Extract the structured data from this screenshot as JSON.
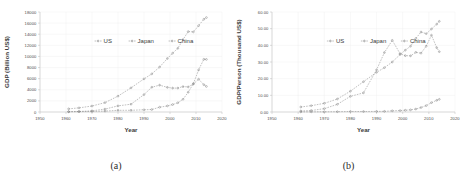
{
  "figure": {
    "panels": [
      {
        "caption": "(a)",
        "name": "gdp-total-chart",
        "chart_index": 0
      },
      {
        "caption": "(b)",
        "name": "gdp-per-person-chart",
        "chart_index": 1
      }
    ],
    "colors": {
      "line": "#8d8d8d",
      "grid": "#ededed",
      "axis": "#b9b9b9",
      "text": "#4a4a4a",
      "background": "#ffffff"
    }
  },
  "chart_data": [
    {
      "type": "line",
      "title": "",
      "xlabel": "Year",
      "ylabel": "GDP (Billion US$)",
      "xlim": [
        1950,
        2020
      ],
      "ylim": [
        0,
        18000
      ],
      "xticks": [
        1950,
        1960,
        1970,
        1980,
        1990,
        2000,
        2010,
        2020
      ],
      "yticks": [
        0,
        2000,
        4000,
        6000,
        8000,
        10000,
        12000,
        14000,
        16000,
        18000
      ],
      "ytick_labels": [
        "0",
        "2000",
        "4000",
        "6000",
        "8000",
        "10000",
        "12000",
        "14000",
        "16000",
        "18000"
      ],
      "grid": true,
      "legend_position": "upper-center",
      "x": [
        1961,
        1965,
        1970,
        1975,
        1980,
        1985,
        1990,
        1993,
        1996,
        1999,
        2001,
        2003,
        2005,
        2007,
        2009,
        2011,
        2013,
        2014
      ],
      "series": [
        {
          "name": "US",
          "values": [
            563,
            744,
            1076,
            1689,
            2857,
            4347,
            5963,
            6859,
            8100,
            9631,
            10582,
            11458,
            13037,
            14478,
            14419,
            15543,
            16692,
            17000
          ]
        },
        {
          "name": "Japan",
          "values": [
            54,
            91,
            213,
            521,
            1105,
            1399,
            3133,
            4455,
            4834,
            4432,
            4303,
            4303,
            4572,
            4515,
            5035,
            5905,
            4919,
            4601
          ]
        },
        {
          "name": "China",
          "values": [
            50,
            70,
            92,
            163,
            303,
            309,
            398,
            445,
            863,
            1094,
            1339,
            1660,
            2286,
            3552,
            5110,
            7573,
            9490,
            9469
          ]
        }
      ]
    },
    {
      "type": "line",
      "title": "",
      "xlabel": "Year",
      "ylabel": "GDP/Person (Thousand US$)",
      "xlim": [
        1950,
        2020
      ],
      "ylim": [
        0,
        60
      ],
      "xticks": [
        1950,
        1960,
        1970,
        1980,
        1990,
        2000,
        2010,
        2020
      ],
      "yticks": [
        0,
        10,
        20,
        30,
        40,
        50,
        60
      ],
      "ytick_labels": [
        "0.00",
        "10.00",
        "20.00",
        "30.00",
        "40.00",
        "50.00",
        "60.00"
      ],
      "grid": true,
      "legend_position": "upper-center",
      "x": [
        1961,
        1965,
        1970,
        1975,
        1980,
        1985,
        1990,
        1993,
        1996,
        1999,
        2001,
        2003,
        2005,
        2007,
        2009,
        2011,
        2013,
        2014
      ],
      "series": [
        {
          "name": "US",
          "values": [
            3.0,
            3.8,
            5.2,
            7.8,
            12.5,
            18.2,
            23.8,
            26.6,
            30.0,
            34.5,
            37.1,
            39.5,
            44.1,
            48.0,
            47.0,
            49.8,
            52.7,
            54.4
          ]
        },
        {
          "name": "Japan",
          "values": [
            0.6,
            0.9,
            2.0,
            4.6,
            9.4,
            11.5,
            25.3,
            35.7,
            43.0,
            35.0,
            33.8,
            33.7,
            35.8,
            35.3,
            39.5,
            46.1,
            38.6,
            36.2
          ]
        },
        {
          "name": "China",
          "values": [
            0.08,
            0.1,
            0.11,
            0.18,
            0.31,
            0.29,
            0.35,
            0.38,
            0.71,
            0.87,
            1.05,
            1.29,
            1.75,
            2.69,
            3.84,
            5.62,
            7.0,
            7.6
          ]
        }
      ]
    }
  ]
}
